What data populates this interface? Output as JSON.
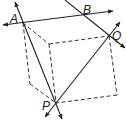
{
  "diagram": {
    "type": "geometry-cube-with-lines",
    "stroke_color": "#222222",
    "labels": {
      "A": "A",
      "B": "B",
      "Q": "Q",
      "P": "P"
    },
    "points": {
      "A": [
        23,
        23
      ],
      "Q": [
        109,
        36
      ],
      "P": [
        56,
        103
      ],
      "inner_top": [
        49,
        44
      ],
      "left_bottom": [
        30,
        84
      ],
      "right_bottom": [
        117,
        95
      ]
    },
    "solid_lines": [
      {
        "name": "line-through-A-horizontal",
        "note": "line through A and B, arrows both ends"
      },
      {
        "name": "line-through-B-Q",
        "note": "line through B and Q, arrows both ends"
      },
      {
        "name": "line-A-P",
        "note": "line through A and P, arrows both ends"
      },
      {
        "name": "line-P-Q",
        "note": "line through P and Q, arrows both ends"
      }
    ],
    "dashed_edges": [
      "A-inner_top",
      "inner_top-Q",
      "Q-right_bottom",
      "right_bottom-P",
      "A-left_bottom",
      "left_bottom-P",
      "inner_top-P"
    ]
  }
}
